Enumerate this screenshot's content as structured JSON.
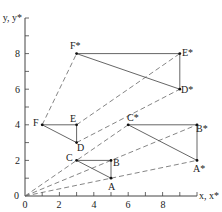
{
  "figure": {
    "type": "coordinate-transformation-diagram",
    "x_axis_label": "x, x*",
    "y_axis_label": "y, y*",
    "x_range": [
      0,
      10
    ],
    "y_range": [
      0,
      10
    ],
    "x_tick_labels": [
      "0",
      "2",
      "4",
      "6",
      "8"
    ],
    "x_tick_values": [
      0,
      2,
      4,
      6,
      8
    ],
    "y_tick_labels": [
      "0",
      "2",
      "4",
      "6",
      "8"
    ],
    "y_tick_values": [
      0,
      2,
      4,
      6,
      8
    ],
    "origin_label": "0",
    "original_points": [
      {
        "label": "A",
        "x": 5,
        "y": 1
      },
      {
        "label": "B",
        "x": 5,
        "y": 2
      },
      {
        "label": "C",
        "x": 3,
        "y": 2
      },
      {
        "label": "D",
        "x": 3,
        "y": 3
      },
      {
        "label": "E",
        "x": 3,
        "y": 4
      },
      {
        "label": "F",
        "x": 1,
        "y": 4
      }
    ],
    "transformed_points": [
      {
        "label": "A*",
        "x": 10,
        "y": 2
      },
      {
        "label": "B*",
        "x": 10,
        "y": 4
      },
      {
        "label": "C*",
        "x": 6,
        "y": 4
      },
      {
        "label": "D*",
        "x": 9,
        "y": 6
      },
      {
        "label": "E*",
        "x": 9,
        "y": 8
      },
      {
        "label": "F*",
        "x": 3,
        "y": 8
      }
    ],
    "triangles": [
      {
        "name": "ABC",
        "vertices": [
          "A",
          "B",
          "C"
        ]
      },
      {
        "name": "DEF",
        "vertices": [
          "D",
          "E",
          "F"
        ]
      },
      {
        "name": "A*B*C*",
        "vertices": [
          "A*",
          "B*",
          "C*"
        ]
      },
      {
        "name": "D*E*F*",
        "vertices": [
          "D*",
          "E*",
          "F*"
        ]
      }
    ],
    "dashed_lines": [
      {
        "from": "O",
        "to": "A*"
      },
      {
        "from": "O",
        "to": "B*"
      },
      {
        "from": "O",
        "to": "C*"
      },
      {
        "from": "D",
        "to": "D*"
      },
      {
        "from": "E",
        "to": "E*"
      },
      {
        "from": "F",
        "to": "F*"
      }
    ]
  }
}
